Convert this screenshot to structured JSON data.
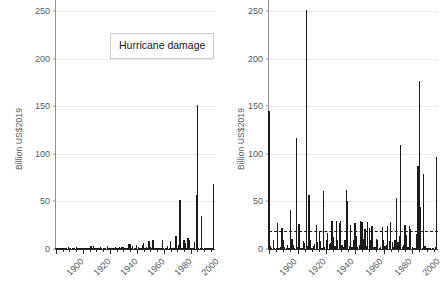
{
  "figure": {
    "background_color": "#ffffff",
    "bar_color": "#1b1b1b",
    "grid_color": "#d9dcde",
    "axis_color": "#8d9295",
    "tick_label_color": "#555b5e"
  },
  "panels": [
    {
      "id": "left",
      "annotation": "Hurricane damage",
      "ylabel": "Billion US$2019",
      "yticks": [
        "0",
        "50",
        "100",
        "150",
        "200",
        "250"
      ],
      "xticks": [
        "1900",
        "1920",
        "1940",
        "1960",
        "1980",
        "2000"
      ]
    },
    {
      "id": "right",
      "annotation": "Damage if all\nhurricanes hit today",
      "ylabel": "Billion US$2019",
      "yticks": [
        "0",
        "50",
        "100",
        "150",
        "200",
        "250"
      ],
      "xticks": [
        "1900",
        "1920",
        "1940",
        "1960",
        "1980",
        "2000"
      ]
    }
  ],
  "chart_data": [
    {
      "type": "bar",
      "id": "hurricane-damage-actual",
      "title": "Hurricane damage",
      "xlabel": "",
      "ylabel": "Billion US$2019",
      "xlim": [
        1900,
        2018
      ],
      "ylim": [
        0,
        262
      ],
      "ytick_values": [
        0,
        50,
        100,
        150,
        200,
        250
      ],
      "xtick_values": [
        1900,
        1920,
        1940,
        1960,
        1980,
        2000
      ],
      "grid": "horizontal-dotted",
      "legend": "none",
      "x": [
        1900,
        1901,
        1902,
        1903,
        1904,
        1905,
        1906,
        1907,
        1908,
        1909,
        1910,
        1911,
        1912,
        1913,
        1914,
        1915,
        1916,
        1917,
        1918,
        1919,
        1920,
        1921,
        1922,
        1923,
        1924,
        1925,
        1926,
        1927,
        1928,
        1929,
        1930,
        1931,
        1932,
        1933,
        1934,
        1935,
        1936,
        1937,
        1938,
        1939,
        1940,
        1941,
        1942,
        1943,
        1944,
        1945,
        1946,
        1947,
        1948,
        1949,
        1950,
        1951,
        1952,
        1953,
        1954,
        1955,
        1956,
        1957,
        1958,
        1959,
        1960,
        1961,
        1962,
        1963,
        1964,
        1965,
        1966,
        1967,
        1968,
        1969,
        1970,
        1971,
        1972,
        1973,
        1974,
        1975,
        1976,
        1977,
        1978,
        1979,
        1980,
        1981,
        1982,
        1983,
        1984,
        1985,
        1986,
        1987,
        1988,
        1989,
        1990,
        1991,
        1992,
        1993,
        1994,
        1995,
        1996,
        1997,
        1998,
        1999,
        2000,
        2001,
        2002,
        2003,
        2004,
        2005,
        2006,
        2007,
        2008,
        2009,
        2010,
        2011,
        2012,
        2013,
        2014,
        2015,
        2016,
        2017
      ],
      "values": [
        0.6,
        0.2,
        0.1,
        0.4,
        0.1,
        0.1,
        1.4,
        0.1,
        0.2,
        1.6,
        0.7,
        0.2,
        0.1,
        0.3,
        0.1,
        2.2,
        0.9,
        0.3,
        0.1,
        1.5,
        0.2,
        0.6,
        0.1,
        0.1,
        0.5,
        0.4,
        3.1,
        0.2,
        2.8,
        0.7,
        0.1,
        0.2,
        0.3,
        2.0,
        0.6,
        1.4,
        0.6,
        0.1,
        3.4,
        0.2,
        0.7,
        1.3,
        0.4,
        0.5,
        2.6,
        1.1,
        0.3,
        2.4,
        0.9,
        2.3,
        2.6,
        0.4,
        0.2,
        1.0,
        5.6,
        5.1,
        0.3,
        2.8,
        0.2,
        1.1,
        4.6,
        1.6,
        0.2,
        0.5,
        4.0,
        6.4,
        1.3,
        2.5,
        0.4,
        8.7,
        2.6,
        1.1,
        9.3,
        0.3,
        0.3,
        1.4,
        1.2,
        0.2,
        0.3,
        9.0,
        1.3,
        0.4,
        0.5,
        3.6,
        1.1,
        8.4,
        1.0,
        0.3,
        1.3,
        13.2,
        1.0,
        4.2,
        52.0,
        0.4,
        1.1,
        10.0,
        6.6,
        1.0,
        11.1,
        9.7,
        0.5,
        0.3,
        0.1,
        7.1,
        57.0,
        152.0,
        0.8,
        0.2,
        35.0,
        1.2,
        0.1,
        0.1,
        0.2,
        0.1,
        0.2,
        0.2,
        0.3,
        68.5
      ],
      "annotations": [
        {
          "text": "Hurricane damage",
          "type": "boxed-label"
        }
      ]
    },
    {
      "type": "bar",
      "id": "hurricane-damage-normalized",
      "title": "Damage if all hurricanes hit today",
      "xlabel": "",
      "ylabel": "Billion US$2019",
      "xlim": [
        1900,
        2018
      ],
      "ylim": [
        0,
        262
      ],
      "ytick_values": [
        0,
        50,
        100,
        150,
        200,
        250
      ],
      "xtick_values": [
        1900,
        1920,
        1940,
        1960,
        1980,
        2000
      ],
      "grid": "horizontal-dotted",
      "legend": "none",
      "reference_line": {
        "value": 18.5,
        "style": "dashed",
        "label": "mean"
      },
      "x": [
        1900,
        1901,
        1902,
        1903,
        1904,
        1905,
        1906,
        1907,
        1908,
        1909,
        1910,
        1911,
        1912,
        1913,
        1914,
        1915,
        1916,
        1917,
        1918,
        1919,
        1920,
        1921,
        1922,
        1923,
        1924,
        1925,
        1926,
        1927,
        1928,
        1929,
        1930,
        1931,
        1932,
        1933,
        1934,
        1935,
        1936,
        1937,
        1938,
        1939,
        1940,
        1941,
        1942,
        1943,
        1944,
        1945,
        1946,
        1947,
        1948,
        1949,
        1950,
        1951,
        1952,
        1953,
        1954,
        1955,
        1956,
        1957,
        1958,
        1959,
        1960,
        1961,
        1962,
        1963,
        1964,
        1965,
        1966,
        1967,
        1968,
        1969,
        1970,
        1971,
        1972,
        1973,
        1974,
        1975,
        1976,
        1977,
        1978,
        1979,
        1980,
        1981,
        1982,
        1983,
        1984,
        1985,
        1986,
        1987,
        1988,
        1989,
        1990,
        1991,
        1992,
        1993,
        1994,
        1995,
        1996,
        1997,
        1998,
        1999,
        2000,
        2001,
        2002,
        2003,
        2004,
        2005,
        2006,
        2007,
        2008,
        2009,
        2010,
        2011,
        2012,
        2013,
        2014,
        2015,
        2016,
        2017
      ],
      "values": [
        145.0,
        3.0,
        1.0,
        9.0,
        1.0,
        1.0,
        27.0,
        1.0,
        2.0,
        22.0,
        9.0,
        2.0,
        1.0,
        4.0,
        0.5,
        41.0,
        11.0,
        4.0,
        1.0,
        117.0,
        2.0,
        26.0,
        0.5,
        1.0,
        8.0,
        6.0,
        252.0,
        3.0,
        57.0,
        10.0,
        1.0,
        3.0,
        5.0,
        25.0,
        7.0,
        19.0,
        8.0,
        1.0,
        61.0,
        2.0,
        9.0,
        17.0,
        5.0,
        6.0,
        30.0,
        13.0,
        3.0,
        29.0,
        10.0,
        27.0,
        29.0,
        4.0,
        2.0,
        10.0,
        62.0,
        50.0,
        3.0,
        25.0,
        2.0,
        10.0,
        27.0,
        14.0,
        2.0,
        4.0,
        29.0,
        28.0,
        11.0,
        21.0,
        3.0,
        28.0,
        22.0,
        9.0,
        24.0,
        2.0,
        2.0,
        11.0,
        9.0,
        1.0,
        2.0,
        23.0,
        10.0,
        3.0,
        4.0,
        24.0,
        8.0,
        28.0,
        7.0,
        2.0,
        9.0,
        54.0,
        7.0,
        14.0,
        109.0,
        2.0,
        4.0,
        25.0,
        15.0,
        2.0,
        24.0,
        21.0,
        2.0,
        1.0,
        0.5,
        16.0,
        87.0,
        177.0,
        44.0,
        1.0,
        79.0,
        3.0,
        0.5,
        0.5,
        1.0,
        0.5,
        1.0,
        1.0,
        2.0,
        96.5
      ],
      "annotations": [
        {
          "text": "Damage if all hurricanes hit today",
          "type": "boxed-label"
        }
      ]
    }
  ]
}
